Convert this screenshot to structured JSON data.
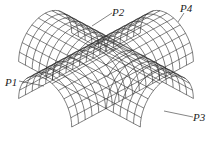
{
  "diagram": {
    "line_color": "#2a2a2a",
    "labels": [
      {
        "id": "P1",
        "text": "P1",
        "x": 5,
        "y": 77,
        "line": [
          19,
          81,
          44,
          86
        ]
      },
      {
        "id": "P2",
        "text": "P2",
        "x": 112,
        "y": 7,
        "line": [
          112,
          13,
          92,
          26
        ]
      },
      {
        "id": "P3",
        "text": "P3",
        "x": 193,
        "y": 112,
        "line": [
          193,
          117,
          164,
          111
        ]
      },
      {
        "id": "P4",
        "text": "P4",
        "x": 180,
        "y": 3,
        "line": [
          184,
          13,
          178,
          22
        ]
      }
    ]
  }
}
